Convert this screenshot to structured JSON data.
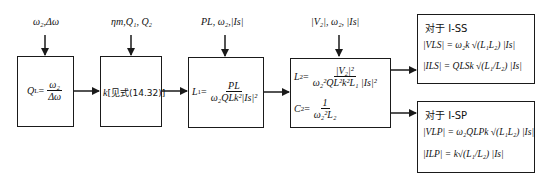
{
  "diagram": {
    "inputs": [
      {
        "id": "in1",
        "label": "ω₂,Δω"
      },
      {
        "id": "in2",
        "label": "ηm,Q₁, Q₂"
      },
      {
        "id": "in3",
        "label": "PL, ω₂,|Is|"
      },
      {
        "id": "in4",
        "label": "|V₂|, ω₂, |Is|"
      }
    ],
    "boxes": [
      {
        "id": "box1",
        "lhs": "Q",
        "lhs_sub": "L",
        "num": "ω₂",
        "den": "Δω"
      },
      {
        "id": "box2",
        "text_k": "k",
        "text_ref": "[见式(14.32)]"
      },
      {
        "id": "box3",
        "lhs": "L",
        "lhs_sub": "1",
        "num": "PL",
        "den": "ω₂QLk²|Is|²"
      },
      {
        "id": "box4",
        "l2_lhs": "L",
        "l2_sub": "2",
        "l2_num": "|V₂|²",
        "l2_den": "ω₂²QL²k²L₁ |Is|²",
        "c2_lhs": "C",
        "c2_sub": "2",
        "c2_num": "1",
        "c2_den": "ω₂²L₂"
      },
      {
        "id": "box5",
        "title": "对于 I-SS",
        "line1": "|VLS| = ω₂k √(L₁L₂) |Is|",
        "line2": "|ILS| = QLSk √(L₁/L₂) |Is|"
      },
      {
        "id": "box6",
        "title": "对于 I-SP",
        "line1": "|VLP| = ω₂QLPk √(L₁L₂) |Is|",
        "line2": "|ILP| = k√(L₁/L₂) |Is|"
      }
    ],
    "colors": {
      "stroke": "#1a1a1a",
      "background": "#ffffff"
    }
  }
}
